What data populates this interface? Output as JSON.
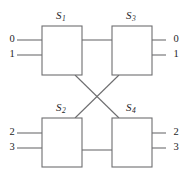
{
  "figure": {
    "type": "switching-network-diagram",
    "stroke_color": "#6e6e70",
    "text_color": "#252527",
    "background_color": "#ffffff"
  },
  "switches": [
    {
      "id": "S1",
      "name": "S",
      "subscript": "1",
      "x": 42,
      "y": 26,
      "w": 40,
      "h": 49,
      "label_x": 56,
      "label_y": 9
    },
    {
      "id": "S3",
      "name": "S",
      "subscript": "3",
      "x": 112,
      "y": 26,
      "w": 40,
      "h": 49,
      "label_x": 126,
      "label_y": 9
    },
    {
      "id": "S2",
      "name": "S",
      "subscript": "2",
      "x": 42,
      "y": 118,
      "w": 40,
      "h": 49,
      "label_x": 56,
      "label_y": 101
    },
    {
      "id": "S4",
      "name": "S",
      "subscript": "4",
      "x": 112,
      "y": 118,
      "w": 40,
      "h": 49,
      "label_x": 126,
      "label_y": 101
    }
  ],
  "inputs": [
    {
      "label": "0",
      "x": 6,
      "y": 34,
      "line_y": 40,
      "line_x1": 17,
      "line_x2": 42
    },
    {
      "label": "1",
      "x": 6,
      "y": 49,
      "line_y": 55,
      "line_x1": 17,
      "line_x2": 42
    },
    {
      "label": "2",
      "x": 6,
      "y": 127,
      "line_y": 133,
      "line_x1": 17,
      "line_x2": 42
    },
    {
      "label": "3",
      "x": 6,
      "y": 142,
      "line_y": 148,
      "line_x1": 17,
      "line_x2": 42
    }
  ],
  "outputs": [
    {
      "label": "0",
      "x": 170,
      "y": 34,
      "line_y": 40,
      "line_x1": 152,
      "line_x2": 166
    },
    {
      "label": "1",
      "x": 170,
      "y": 49,
      "line_y": 55,
      "line_x1": 152,
      "line_x2": 166
    },
    {
      "label": "2",
      "x": 170,
      "y": 127,
      "line_y": 133,
      "line_x1": 152,
      "line_x2": 166
    },
    {
      "label": "3",
      "x": 170,
      "y": 142,
      "line_y": 148,
      "line_x1": 152,
      "line_x2": 166
    }
  ],
  "links": {
    "straight": [
      {
        "from": "S1",
        "to": "S3",
        "x1": 82,
        "y1": 40,
        "x2": 112,
        "y2": 40
      },
      {
        "from": "S2",
        "to": "S4",
        "x1": 82,
        "y1": 150,
        "x2": 112,
        "y2": 150
      }
    ],
    "crossed": [
      {
        "from": "S1",
        "to": "S4",
        "x1": 75,
        "y1": 75,
        "x2": 119,
        "y2": 118
      },
      {
        "from": "S2",
        "to": "S3",
        "x1": 75,
        "y1": 118,
        "x2": 119,
        "y2": 75
      }
    ]
  }
}
